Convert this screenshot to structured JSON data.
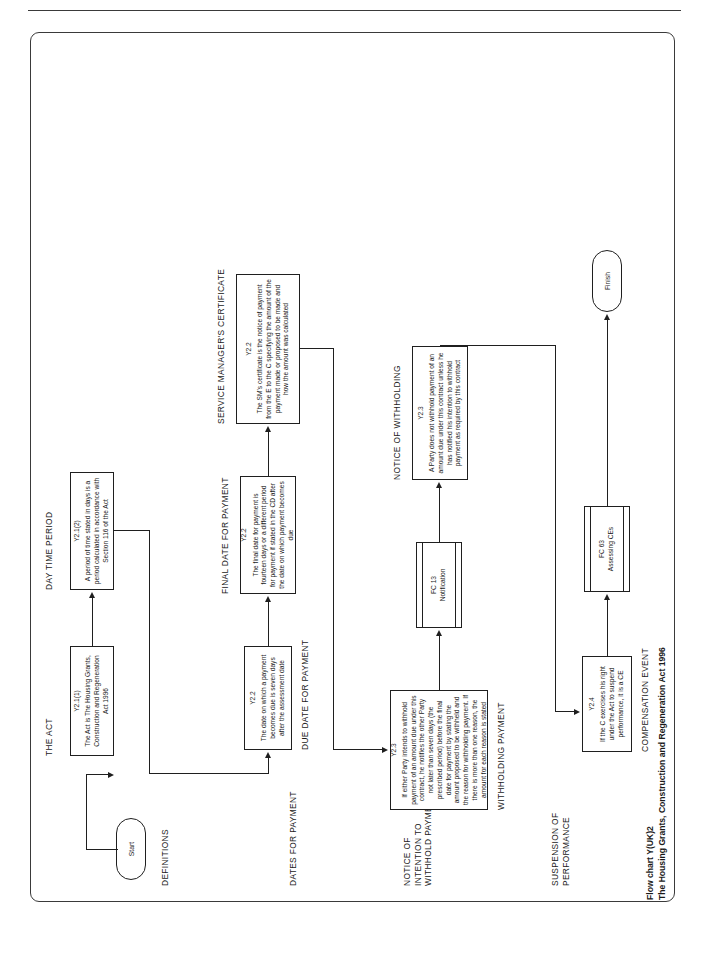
{
  "sheet": {
    "title_line1": "Flow chart Y(UK)2",
    "title_line2": "The Housing Grants, Construction and Regeneration Act 1996"
  },
  "terminators": {
    "start": "Start",
    "finish": "Finish"
  },
  "captions": {
    "definitions": "DEFINITIONS",
    "the_act": "THE ACT",
    "day_time_period": "DAY TIME PERIOD",
    "service_managers_certificate": "SERVICE MANAGER'S CERTIFICATE",
    "final_date_for_payment": "FINAL DATE FOR PAYMENT",
    "dates_for_payment": "DATES FOR PAYMENT",
    "due_date_for_payment": "DUE DATE FOR PAYMENT",
    "notice_of_withholding": "NOTICE OF WITHHOLDING",
    "notice_of_intention_to_withhold_payment": "NOTICE OF INTENTION TO WITHHOLD PAYMENT",
    "withholding_payment": "WITHHOLDING PAYMENT",
    "suspension_of_performance": "SUSPENSION OF PERFORMANCE",
    "compensation_event": "COMPENSATION EVENT"
  },
  "nodes": {
    "act": {
      "ref": "Y2.1(1)",
      "body": "The Act is The Housing Grants, Construction and Regeneration Act 1996"
    },
    "day_time_period": {
      "ref": "Y2.1(2)",
      "body": "A period of time stated in days is a period calculated in accordance with Section 116 of the Act"
    },
    "due_date": {
      "ref": "Y2.2",
      "body": "The date on which a payment becomes due is seven days after the assessment date"
    },
    "final_date": {
      "ref": "Y2.2",
      "body": "The final date for payment is fourteen days or a different period for payment if stated in the CD after the date on which payment becomes due"
    },
    "sm_certificate": {
      "ref": "Y2.2",
      "body": "The SM's certificate is the notice of payment from the E to the C specifying the amount of the payment made or proposed to be made and how the amount was calculated"
    },
    "withholding_payment": {
      "ref": "Y2.3",
      "body": "If either Party intends to withhold payment of an amount due under this contract, he notifies the other Party not later than seven days (the prescribed period) before the final date for payment by stating the amount proposed to be withheld and the reason for withholding payment. If there is more than one reason, the amount for each reason is stated"
    },
    "notice_of_withholding": {
      "ref": "Y2.3",
      "body": "A Party does not withhold payment of an amount due under this contract unless he has notified his intention to withhold payment as required by this contract"
    },
    "suspension": {
      "ref": "Y2.4",
      "body": "If the C exercises his right under the Act to suspend performance, it is a CE"
    }
  },
  "subprocesses": {
    "fc13": {
      "ref": "FC 13",
      "body": "Notification"
    },
    "fc63": {
      "ref": "FC 63",
      "body": "Assessing CEs"
    }
  }
}
